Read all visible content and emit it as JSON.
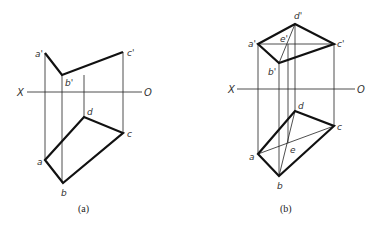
{
  "figure_a": {
    "caption": "(a)",
    "axis": {
      "left_label": "X",
      "right_label": "O"
    },
    "labels": {
      "a_prime": "a'",
      "b_prime": "b'",
      "c_prime": "c'",
      "a": "a",
      "b": "b",
      "c": "c",
      "d": "d"
    }
  },
  "figure_b": {
    "caption": "(b)",
    "axis": {
      "left_label": "X",
      "right_label": "O"
    },
    "labels": {
      "a_prime": "a'",
      "b_prime": "b'",
      "c_prime": "c'",
      "d_prime": "d'",
      "e_prime": "e'",
      "a": "a",
      "b": "b",
      "c": "c",
      "d": "d",
      "e": "e"
    }
  }
}
